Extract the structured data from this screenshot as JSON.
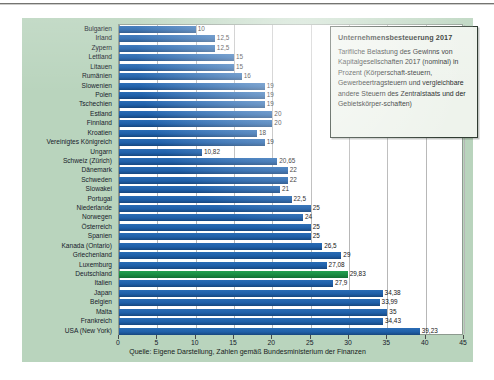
{
  "figure": {
    "source_note": "Quelle: Eigene Darstellung, Zahlen gemäß Bundesministerium der Finanzen",
    "legend": {
      "title": "Unternehmensbesteuerung 2017",
      "body": "Tarifliche Belastung des Gewinns von Kapitalgesellschaften 2017 (nominal) in Prozent (Körperschaft-steuern, Gewerbeertragsteuern und vergleichbare andere Steuern des Zentralstaats und der Gebietskörper-schaften)"
    },
    "colors": {
      "background": "#b9d4bd",
      "bar": "#1f5fa8",
      "highlight_bar": "#1a8a42",
      "plot_background": "#ffffff",
      "grid": "#b7b7b7"
    },
    "highlight_category": "Deutschland"
  },
  "chart_data": {
    "type": "bar",
    "orientation": "horizontal",
    "title": "Unternehmensbesteuerung 2017",
    "subtitle": "Tarifliche Belastung des Gewinns von Kapitalgesellschaften 2017 (nominal) in Prozent",
    "xlabel": "",
    "ylabel": "",
    "xlim": [
      0,
      45
    ],
    "xticks": [
      0,
      5,
      10,
      15,
      20,
      25,
      30,
      35,
      40,
      45
    ],
    "xtick_labels": [
      "0",
      "5",
      "10",
      "15",
      "20",
      "25",
      "30",
      "35",
      "40",
      "45"
    ],
    "grid": true,
    "legend": false,
    "unit": "%",
    "decimal_separator": ",",
    "categories": [
      "Bulgarien",
      "Irland",
      "Zypern",
      "Lettland",
      "Litauen",
      "Rumänien",
      "Slowenien",
      "Polen",
      "Tschechien",
      "Estland",
      "Finnland",
      "Kroatien",
      "Vereinigtes Königreich",
      "Ungarn",
      "Schweiz (Zürich)",
      "Dänemark",
      "Schweden",
      "Slowakei",
      "Portugal",
      "Niederlande",
      "Norwegen",
      "Österreich",
      "Spanien",
      "Kanada (Ontario)",
      "Griechenland",
      "Luxemburg",
      "Deutschland",
      "Italien",
      "Japan",
      "Belgien",
      "Malta",
      "Frankreich",
      "USA (New York)"
    ],
    "values": [
      10,
      12.5,
      12.5,
      15,
      15,
      16,
      19,
      19,
      19,
      20,
      20,
      18,
      19,
      10.82,
      20.65,
      22,
      22,
      21,
      22.5,
      25,
      24,
      25,
      25,
      26.5,
      29,
      27.08,
      29.83,
      27.9,
      34.38,
      33.99,
      35,
      34.43,
      39.23
    ],
    "value_labels": [
      "10",
      "12,5",
      "12,5",
      "15",
      "15",
      "16",
      "19",
      "19",
      "19",
      "20",
      "20",
      "18",
      "19",
      "10,82",
      "20,65",
      "22",
      "22",
      "21",
      "22,5",
      "25",
      "24",
      "25",
      "25",
      "26,5",
      "29",
      "27,08",
      "29,83",
      "27,9",
      "34,38",
      "33,99",
      "35",
      "34,43",
      "39,23"
    ]
  }
}
